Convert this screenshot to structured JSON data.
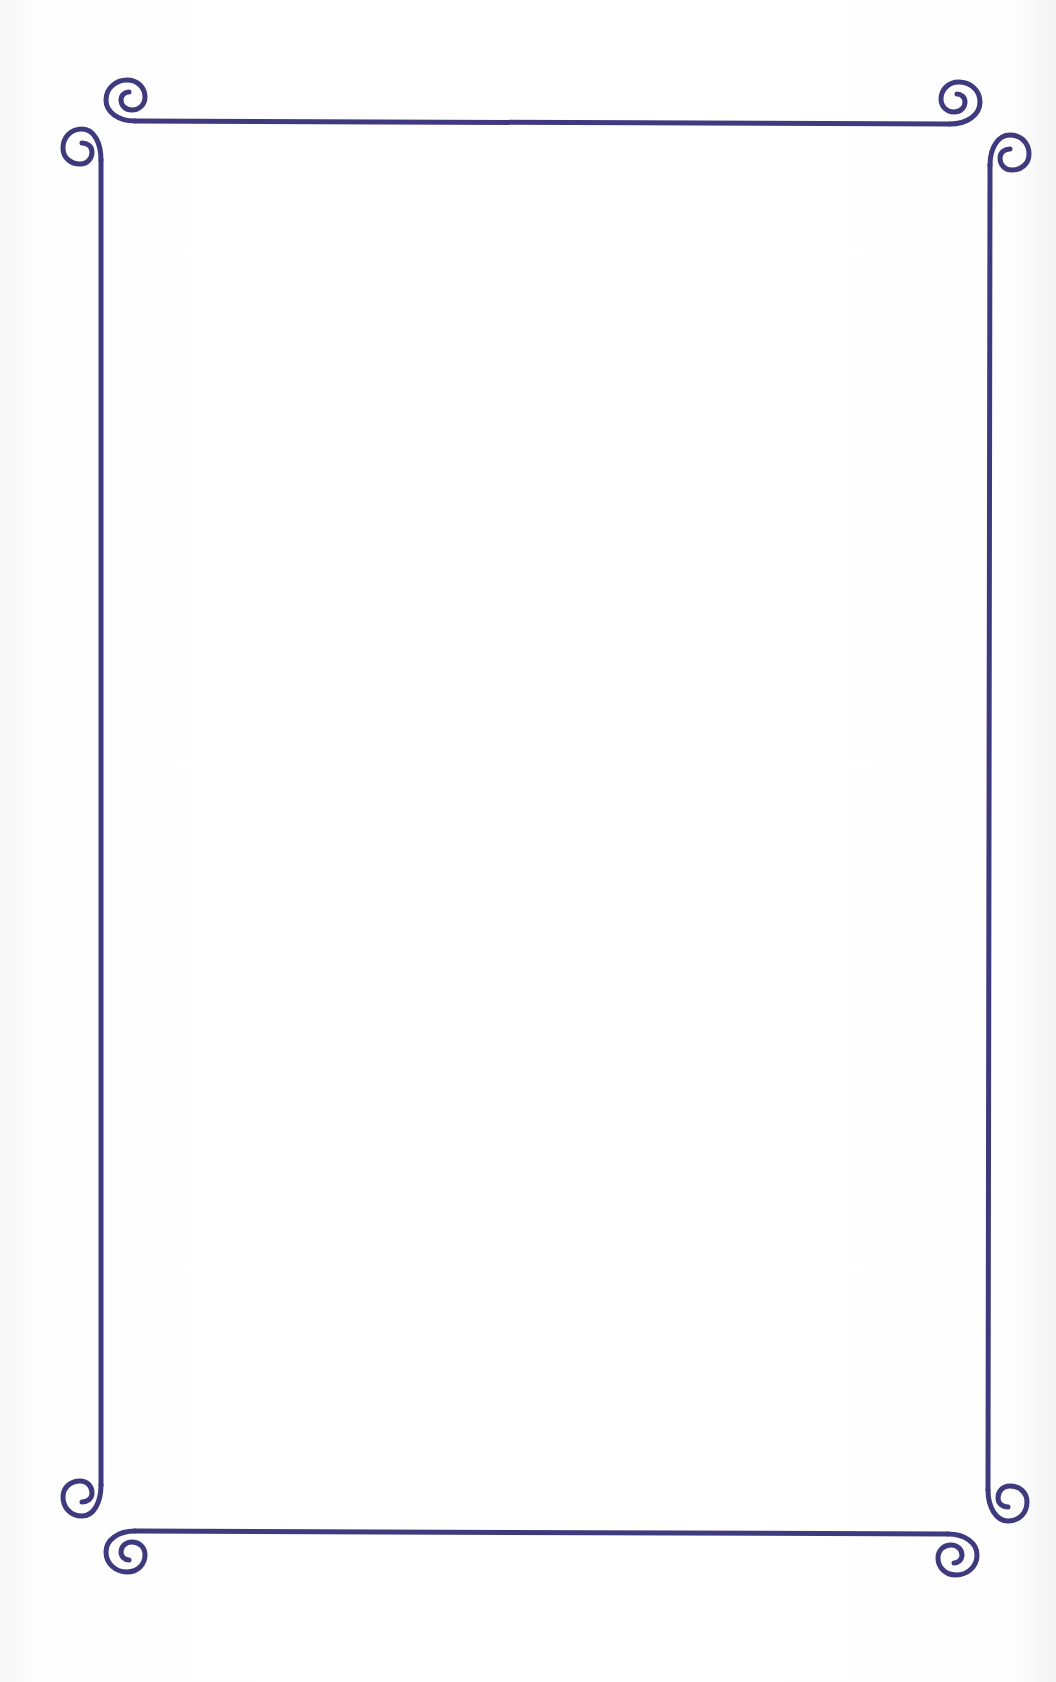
{
  "page": {
    "type": "decorative-border-page",
    "background_color": "#ffffff",
    "border_color": "#3f3a7e",
    "content": ""
  },
  "border": {
    "style": "scroll-flourish",
    "corners": [
      "top-left",
      "top-right",
      "bottom-left",
      "bottom-right"
    ],
    "flourish_icon": "spiral-scroll-icon"
  }
}
